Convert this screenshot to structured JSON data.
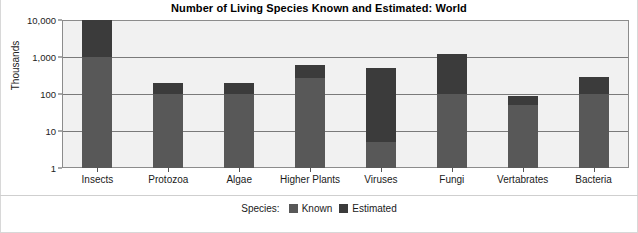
{
  "chart_data": {
    "type": "bar",
    "title": "Number of Living Species Known and Estimated: World",
    "xlabel": "",
    "ylabel": "Thousands",
    "yscale": "log",
    "ylim": [
      1,
      10000
    ],
    "ytick_labels": [
      "10,000",
      "1,000",
      "100",
      "10",
      "1"
    ],
    "ytick_values": [
      10000,
      1000,
      100,
      10,
      1
    ],
    "grid": true,
    "stacked": true,
    "legend_title": "Species:",
    "legend_position": "bottom-center",
    "categories": [
      "Insects",
      "Protozoa",
      "Algae",
      "Higher Plants",
      "Viruses",
      "Fungi",
      "Vertabrates",
      "Bacteria"
    ],
    "series": [
      {
        "name": "Known",
        "color": "#585858",
        "values": [
          1000,
          100,
          100,
          270,
          5,
          100,
          50,
          100
        ]
      },
      {
        "name": "Estimated",
        "color": "#3b3b3b",
        "values": [
          10000,
          200,
          200,
          600,
          500,
          1200,
          90,
          280
        ]
      }
    ]
  },
  "colors": {
    "known": "#585858",
    "estimated": "#3b3b3b",
    "plot_background": "#f1f1f1",
    "gridline": "#7a7a7a",
    "axis": "#8c8c8c",
    "text": "#1a1a1a"
  }
}
